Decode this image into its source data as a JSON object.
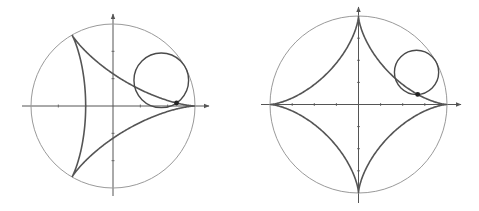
{
  "figure": {
    "colors": {
      "background": "#ffffff",
      "fixed_circle": "#9a9a9a",
      "curve": "#555555",
      "rolling_circle": "#4a4a4a",
      "axes": "#555555",
      "tracing_point": "#222222"
    }
  },
  "panels": [
    {
      "name": "deltoid",
      "cusps": 3,
      "center": [
        113,
        106
      ],
      "fixed_radius": 82,
      "rolling_radius_ratio": 0.3333,
      "rolling_circle_angle_deg": 28,
      "axis_extent": {
        "x": [
          22,
          209
        ],
        "y": [
          14,
          196
        ]
      },
      "tick_spacing": 27.33,
      "tick_count_each_side": 2
    },
    {
      "name": "astroid",
      "cusps": 4,
      "center": [
        358.5,
        104.5
      ],
      "fixed_radius": 88.5,
      "rolling_radius_ratio": 0.25,
      "rolling_circle_angle_deg": 29,
      "axis_extent": {
        "x": [
          261,
          461
        ],
        "y": [
          7,
          203
        ]
      },
      "tick_spacing": 22.1,
      "tick_count_each_side": 3
    }
  ]
}
